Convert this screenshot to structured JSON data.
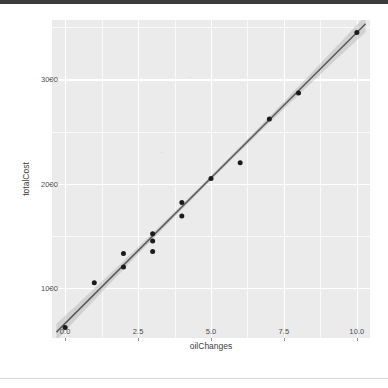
{
  "window": {
    "top_bar_color": "#3c3c3c",
    "background_color": "#ffffff"
  },
  "chart_data": {
    "type": "scatter",
    "title": "",
    "subtitle": "",
    "xlabel": "oilChanges",
    "ylabel": "totalCost",
    "xlim": [
      -0.45,
      10.45
    ],
    "ylim": [
      520,
      3570
    ],
    "x_ticks": [
      0.0,
      2.5,
      5.0,
      7.5,
      10.0
    ],
    "x_tick_labels": [
      "0.0",
      "2.5",
      "5.0",
      "7.5",
      "10.0"
    ],
    "y_ticks": [
      1000,
      2000,
      3000
    ],
    "y_tick_labels": [
      "1000",
      "2000",
      "3000"
    ],
    "grid": true,
    "grid_color": "#ffffff",
    "panel_color": "#ebebeb",
    "legend": "none",
    "point_color": "#1b1b1b",
    "line_color": "#5a5a5a",
    "band_color": "#9a9a9a",
    "x": [
      0,
      1,
      2,
      2,
      3,
      3,
      3,
      4,
      4,
      5,
      6,
      7,
      8,
      10
    ],
    "y": [
      620,
      1050,
      1330,
      1200,
      1520,
      1450,
      1350,
      1820,
      1690,
      2050,
      2200,
      2620,
      2870,
      3450
    ],
    "points": [
      {
        "x": 0,
        "y": 620
      },
      {
        "x": 1,
        "y": 1050
      },
      {
        "x": 2,
        "y": 1330
      },
      {
        "x": 2,
        "y": 1200
      },
      {
        "x": 3,
        "y": 1520
      },
      {
        "x": 3,
        "y": 1450
      },
      {
        "x": 3,
        "y": 1350
      },
      {
        "x": 4,
        "y": 1820
      },
      {
        "x": 4,
        "y": 1690
      },
      {
        "x": 5,
        "y": 2050
      },
      {
        "x": 6,
        "y": 2200
      },
      {
        "x": 7,
        "y": 2620
      },
      {
        "x": 8,
        "y": 2870
      },
      {
        "x": 10,
        "y": 3450
      }
    ],
    "fit": {
      "type": "linear",
      "intercept": 660,
      "slope": 279,
      "x_range": [
        -0.3,
        10.3
      ],
      "confidence_interval": 0.95,
      "band_halfwidth_min": 22,
      "band_halfwidth_max": 80
    }
  }
}
